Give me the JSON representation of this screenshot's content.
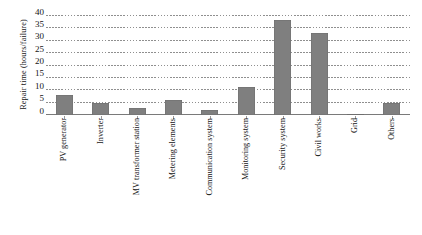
{
  "chart_data": {
    "type": "bar",
    "title": "",
    "xlabel": "",
    "ylabel": "Repair time (hours/failure)",
    "categories": [
      "PV generator",
      "Inverter",
      "MV transformer station",
      "Metering elements",
      "Communication system",
      "Monitoring system",
      "Security system",
      "Civil works",
      "Grid",
      "Others"
    ],
    "values": [
      8,
      5,
      3,
      6,
      2,
      11.5,
      38.5,
      33,
      0.5,
      5
    ],
    "ylim": [
      0,
      40
    ],
    "yticks": [
      0,
      5,
      10,
      15,
      20,
      25,
      30,
      35,
      40
    ],
    "ytick_labels": [
      "0",
      "5",
      "10",
      "15",
      "20",
      "25",
      "30",
      "35",
      "40"
    ],
    "grid": true,
    "grid_style": "dashed-horizontal",
    "legend": false,
    "legend_position": "none",
    "bar_color": "#7f7f7f",
    "background_color": "#ffffff",
    "axis_color": "#7a7a7a",
    "text_color": "#141414"
  }
}
